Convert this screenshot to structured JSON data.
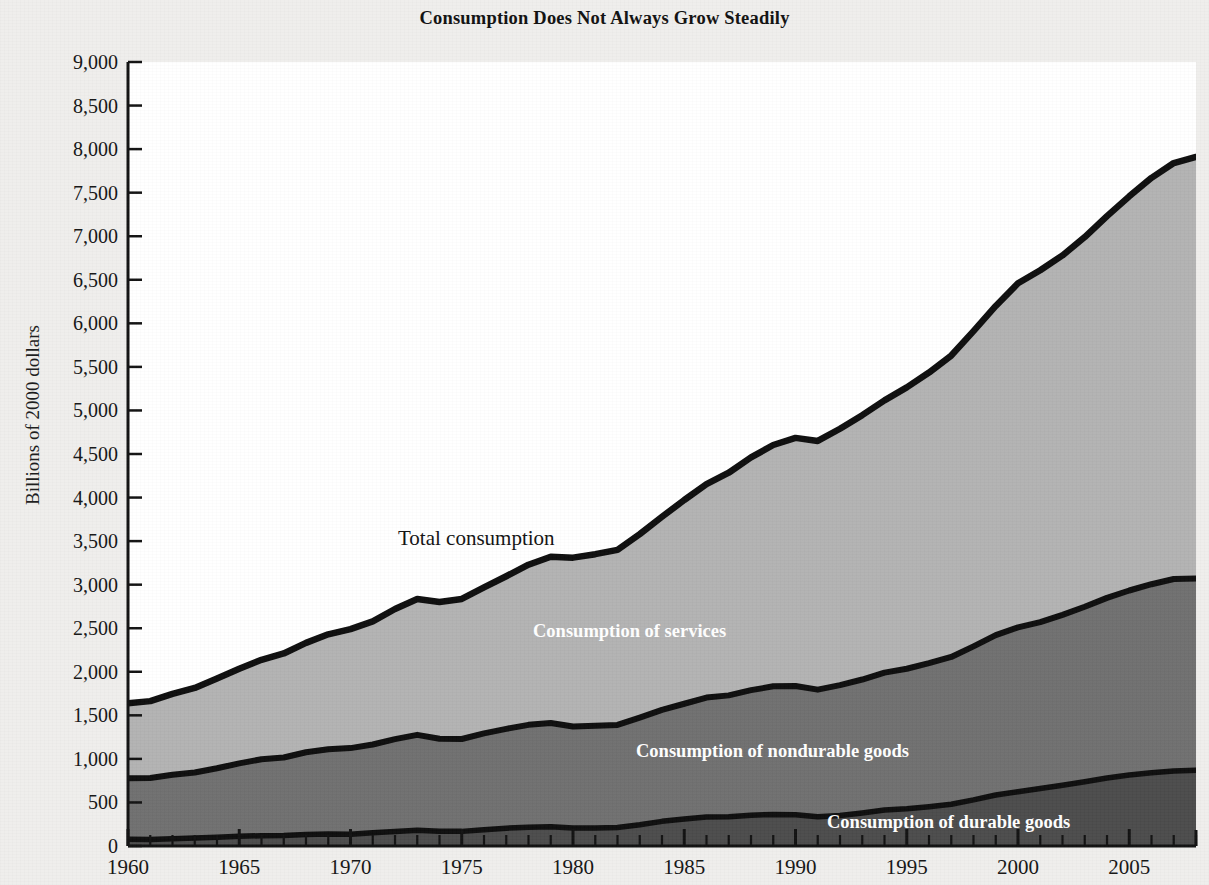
{
  "title": "Consumption Does Not Always Grow Steadily",
  "axis": {
    "ylabel": "Billions of 2000 dollars",
    "y_ticks": [
      "0",
      "500",
      "1,000",
      "1,500",
      "2,000",
      "2,500",
      "3,000",
      "3,500",
      "4,000",
      "4,500",
      "5,000",
      "5,500",
      "6,000",
      "6,500",
      "7,000",
      "7,500",
      "8,000",
      "8,500",
      "9,000"
    ],
    "x_ticks": [
      "1960",
      "1965",
      "1970",
      "1975",
      "1980",
      "1985",
      "1990",
      "1995",
      "2000",
      "2005"
    ]
  },
  "series_labels": {
    "total": "Total consumption",
    "services": "Consumption of services",
    "nondurable": "Consumption of nondurable goods",
    "durable": "Consumption of durable goods"
  },
  "colors": {
    "services_fill": "#b2b2b2",
    "nondurable_fill": "#6f6f6f",
    "durable_fill": "#4b4b4b",
    "line": "#0d0d0d",
    "page_background": "#efeeec",
    "plot_background": "#ffffff"
  },
  "chart_data": {
    "type": "area",
    "stacked": true,
    "title": "Consumption Does Not Always Grow Steadily",
    "xlabel": "",
    "ylabel": "Billions of 2000 dollars",
    "xlim": [
      1960,
      2008
    ],
    "ylim": [
      0,
      9000
    ],
    "grid": false,
    "legend": "inline annotations inside the bands",
    "annotations": [
      {
        "text": "Total consumption",
        "x": 1977.5,
        "y": 3560
      },
      {
        "text": "Consumption of services",
        "x": 1983.5,
        "y": 2620
      },
      {
        "text": "Consumption of nondurable goods",
        "x": 1994.0,
        "y": 900
      },
      {
        "text": "Consumption of durable goods",
        "x": 1999.5,
        "y": 270
      }
    ],
    "x": [
      1960,
      1961,
      1962,
      1963,
      1964,
      1965,
      1966,
      1967,
      1968,
      1969,
      1970,
      1971,
      1972,
      1973,
      1974,
      1975,
      1976,
      1977,
      1978,
      1979,
      1980,
      1981,
      1982,
      1983,
      1984,
      1985,
      1986,
      1987,
      1988,
      1989,
      1990,
      1991,
      1992,
      1993,
      1994,
      1995,
      1996,
      1997,
      1998,
      1999,
      2000,
      2001,
      2002,
      2003,
      2004,
      2005,
      2006,
      2007,
      2008
    ],
    "series": [
      {
        "name": "Consumption of durable goods",
        "values": [
          78,
          75,
          83,
          91,
          100,
          111,
          118,
          120,
          132,
          138,
          136,
          151,
          167,
          180,
          168,
          168,
          187,
          205,
          216,
          221,
          206,
          208,
          212,
          244,
          283,
          309,
          332,
          337,
          353,
          363,
          358,
          335,
          351,
          380,
          413,
          427,
          451,
          479,
          529,
          585,
          623,
          660,
          698,
          738,
          780,
          815,
          840,
          860,
          870
        ]
      },
      {
        "name": "Consumption of nondurable goods",
        "values": [
          700,
          706,
          734,
          752,
          792,
          838,
          878,
          896,
          944,
          972,
          988,
          1014,
          1060,
          1096,
          1063,
          1060,
          1106,
          1140,
          1175,
          1190,
          1166,
          1171,
          1178,
          1230,
          1280,
          1324,
          1372,
          1392,
          1436,
          1470,
          1479,
          1460,
          1496,
          1531,
          1577,
          1608,
          1648,
          1691,
          1763,
          1836,
          1886,
          1910,
          1956,
          2008,
          2068,
          2118,
          2165,
          2205,
          2200
        ]
      },
      {
        "name": "Consumption of services",
        "values": [
          862,
          882,
          930,
          972,
          1030,
          1086,
          1142,
          1194,
          1256,
          1320,
          1366,
          1413,
          1494,
          1560,
          1570,
          1608,
          1676,
          1752,
          1838,
          1910,
          1938,
          1971,
          2010,
          2106,
          2216,
          2339,
          2450,
          2556,
          2672,
          2770,
          2848,
          2855,
          2943,
          3035,
          3126,
          3230,
          3336,
          3460,
          3618,
          3779,
          3951,
          4040,
          4126,
          4244,
          4382,
          4525,
          4665,
          4775,
          4840
        ]
      }
    ],
    "totals": [
      1640,
      1663,
      1747,
      1815,
      1922,
      2035,
      2138,
      2210,
      2332,
      2430,
      2490,
      2578,
      2721,
      2836,
      2801,
      2836,
      2969,
      3097,
      3229,
      3321,
      3310,
      3350,
      3400,
      3580,
      3779,
      3972,
      4154,
      4285,
      4461,
      4603,
      4685,
      4650,
      4790,
      4946,
      5116,
      5265,
      5435,
      5630,
      5910,
      6200,
      6460,
      6610,
      6780,
      6990,
      7230,
      7458,
      7670,
      7840,
      7910
    ]
  }
}
